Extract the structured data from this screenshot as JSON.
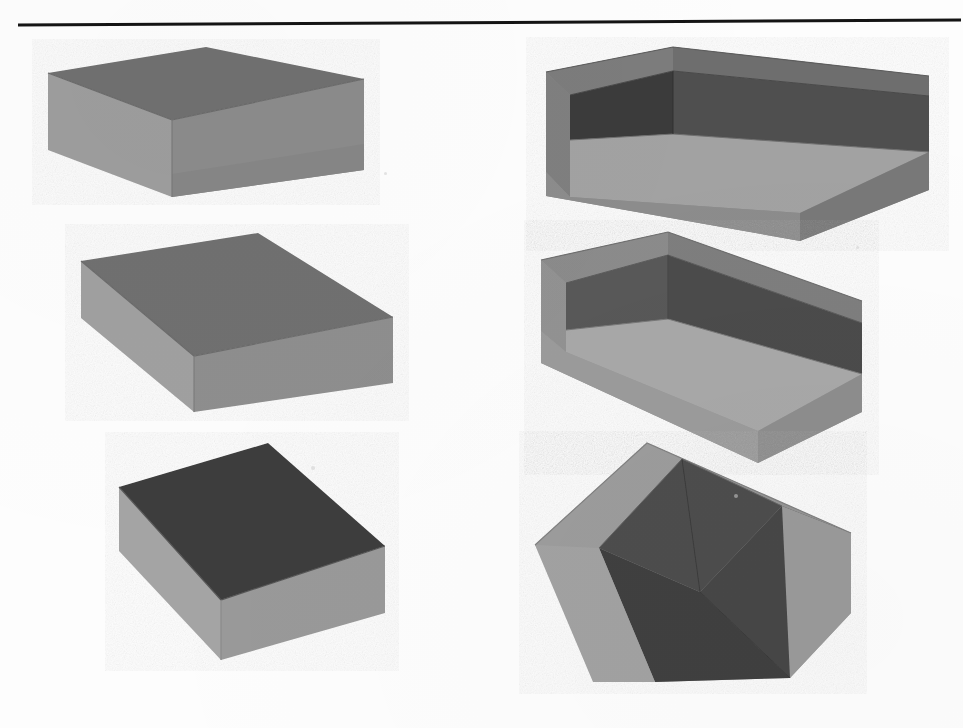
{
  "figure": {
    "title": "Six rendered rectangular boxes",
    "background_color": "#fdfdfd",
    "columns": 2,
    "rows": 3,
    "total_shapes": 6
  },
  "rule": {
    "name": "horizontal-rule",
    "color": "#141414",
    "x1": 2,
    "y1": 7,
    "x2": 945,
    "y2": 2,
    "thickness": 3
  },
  "palette": {
    "top_face_mid": "#6f6f6f",
    "top_face_dark": "#3d3d3d",
    "side_light": "#9a9a9a",
    "side_lighter": "#a6a6a6",
    "side_mid": "#8a8a8a",
    "side_dark": "#6a6a6a",
    "interior_dark": "#3a3a3a",
    "interior_mid": "#555555",
    "interior_light": "#8f8f8f",
    "edge_line": "#5a5a5a",
    "paper": "#fdfdfd"
  },
  "shapes": [
    {
      "id": "box-top-left",
      "name": "closed-box-top-left",
      "kind": "closed-box",
      "column": "left",
      "row": 1,
      "label": "Closed box, upper left",
      "faces": {
        "top": {
          "fill": "#6f6f6f",
          "points": "48,73 206,47 364,79 172,120"
        },
        "left": {
          "fill": "#9d9d9d",
          "points": "48,73 172,120 172,197 48,150"
        },
        "right": {
          "fill": "#8b8b8b",
          "points": "172,120 364,79 364,170 172,197"
        }
      },
      "band": {
        "fill": "#828282",
        "points": "172,173 364,143 364,170 172,197"
      }
    },
    {
      "id": "box-mid-left",
      "name": "closed-box-middle-left",
      "kind": "closed-box",
      "column": "left",
      "row": 2,
      "label": "Closed box, middle left",
      "faces": {
        "top": {
          "fill": "#6f6f6f",
          "points": "81,261 258,233 393,317 194,356"
        },
        "left": {
          "fill": "#a0a0a0",
          "points": "81,261 194,356 194,412 81,318"
        },
        "right": {
          "fill": "#8e8e8e",
          "points": "194,356 393,317 393,383 194,412"
        }
      },
      "band": null
    },
    {
      "id": "box-bot-left",
      "name": "closed-box-bottom-left",
      "kind": "closed-box",
      "column": "left",
      "row": 3,
      "label": "Closed box, lower left, dark top face",
      "faces": {
        "top": {
          "fill": "#3d3d3d",
          "points": "119,487 268,443 385,546 221,600"
        },
        "left": {
          "fill": "#a4a4a4",
          "points": "119,487 221,600 221,660 119,551"
        },
        "right": {
          "fill": "#999999",
          "points": "221,600 385,546 385,613 221,660"
        }
      },
      "band": null
    },
    {
      "id": "tray-top-right",
      "name": "open-box-top-right",
      "kind": "open-box",
      "column": "right",
      "row": 1,
      "label": "Open-top box, upper right",
      "faces": {
        "rim_back_left": {
          "fill": "#7c7c7c",
          "points": "546,72 673,47 673,70 570,95"
        },
        "interior": {
          "fill": "#3a3a3a",
          "points": "570,95 673,70 673,135 570,140"
        },
        "interior_right": {
          "fill": "#4e4e4e",
          "points": "673,70 929,95 929,150 673,135"
        },
        "wall_left_outer": {
          "fill": "#7f7f7f",
          "points": "546,72 570,95 570,196 546,168"
        },
        "floor": {
          "fill": "#a0a0a0",
          "points": "570,140 673,135 929,150 800,212 570,196"
        },
        "wall_front": {
          "fill": "#8a8a8a",
          "points": "546,168 570,196 800,212 800,240 546,196"
        },
        "wall_right_outer": {
          "fill": "#7a7a7a",
          "points": "800,212 929,150 929,190 800,240"
        },
        "rim_right": {
          "fill": "#6d6d6d",
          "points": "673,47 929,76 929,95 673,70"
        }
      }
    },
    {
      "id": "tray-mid-right",
      "name": "open-box-middle-right",
      "kind": "open-box",
      "column": "right",
      "row": 2,
      "label": "Open-top box, middle right",
      "faces": {
        "rim_back_left": {
          "fill": "#8d8d8d",
          "points": "541,260 668,232 668,254 566,282"
        },
        "interior": {
          "fill": "#515151",
          "points": "566,282 668,254 668,320 566,330"
        },
        "interior_right": {
          "fill": "#4a4a4a",
          "points": "668,254 862,322 862,372 668,320"
        },
        "wall_left_outer": {
          "fill": "#8f8f8f",
          "points": "541,260 566,282 566,352 541,330"
        },
        "floor": {
          "fill": "#a6a6a6",
          "points": "566,330 668,320 862,372 758,430 566,352"
        },
        "wall_front": {
          "fill": "#989898",
          "points": "541,330 566,352 758,430 758,462 541,362"
        },
        "wall_right_outer": {
          "fill": "#8c8c8c",
          "points": "758,430 862,372 862,412 758,462"
        },
        "rim_right": {
          "fill": "#7e7e7e",
          "points": "668,232 862,300 862,322 668,254"
        }
      }
    },
    {
      "id": "tray-bot-right",
      "name": "open-box-bottom-right",
      "kind": "open-box",
      "column": "right",
      "row": 3,
      "label": "Open-top shallow box, lower right",
      "faces": {
        "rim_back_left": {
          "fill": "#9a9a9a",
          "points": "535,545 647,443 682,458 599,547"
        },
        "interior": {
          "fill": "#4a4a4a",
          "points": "599,547 682,458 780,503 700,590"
        },
        "interior_right": {
          "fill": "#4e4e4e",
          "points": "682,458 851,533 780,503 780,503"
        },
        "wall_left_outer": {
          "fill": "#9e9e9e",
          "points": "535,545 599,547 655,680 593,682"
        },
        "floor": {
          "fill": "#3f3f3f",
          "points": "599,547 700,590 790,676 655,680"
        },
        "wall_front": {
          "fill": "#4a4a4a",
          "points": "655,680 790,676 790,676 655,680"
        },
        "wall_right_outer": {
          "fill": "#9c9c9c",
          "points": "780,503 851,533 851,612 790,676"
        },
        "rim_right": {
          "fill": "#8f8f8f",
          "points": "647,443 851,533 780,503 682,458"
        }
      }
    }
  ],
  "specks": [
    {
      "x": 311,
      "y": 466,
      "size": 4
    },
    {
      "x": 734,
      "y": 494,
      "size": 4
    },
    {
      "x": 856,
      "y": 246,
      "size": 3
    },
    {
      "x": 384,
      "y": 172,
      "size": 3
    }
  ]
}
